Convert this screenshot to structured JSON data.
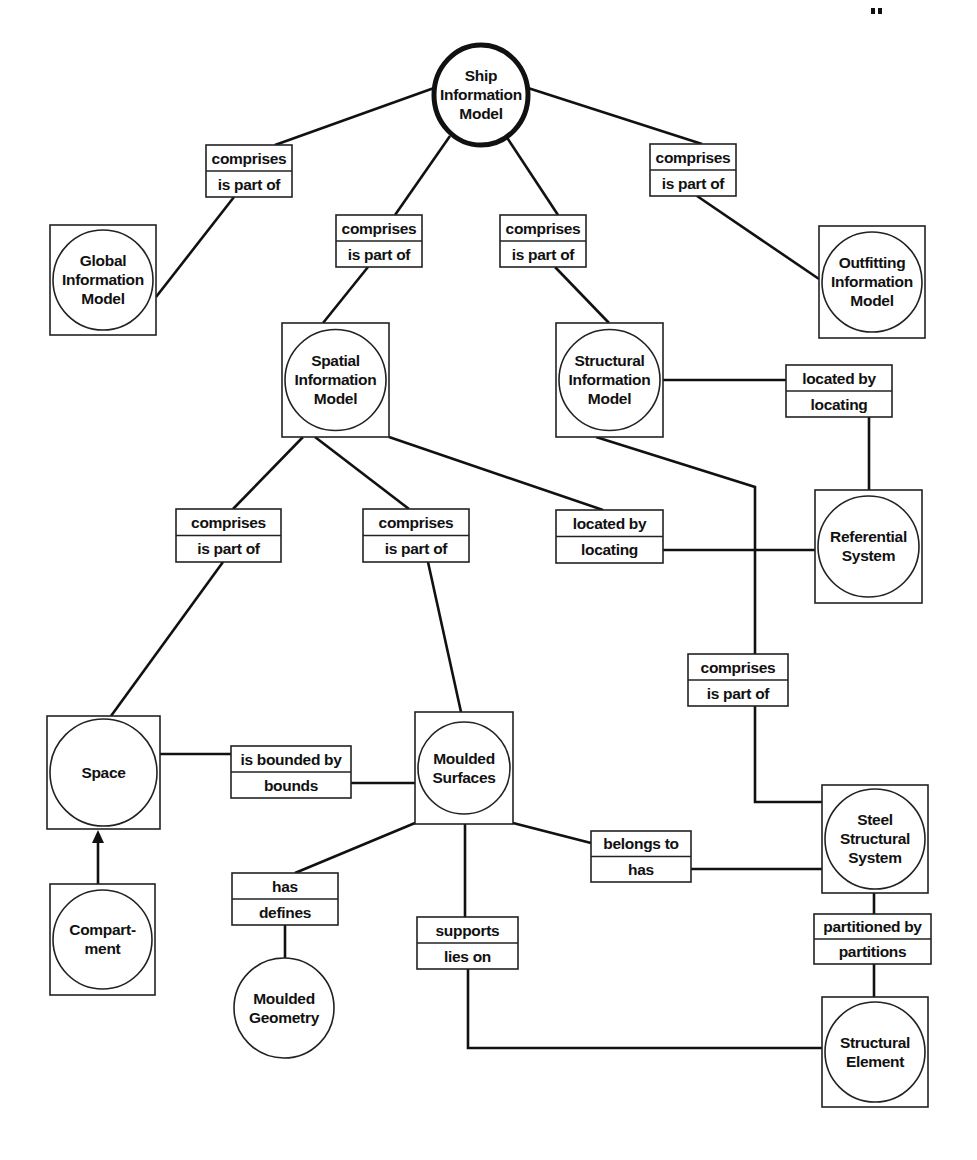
{
  "diagram": {
    "nodes": [
      {
        "id": "ship",
        "lines": [
          "Ship",
          "Information",
          "Model"
        ],
        "shape": "ellipse-root",
        "cx": 481,
        "cy": 95,
        "rx": 47,
        "ry": 50
      },
      {
        "id": "global",
        "lines": [
          "Global",
          "Information",
          "Model"
        ],
        "shape": "box-circle",
        "x": 50,
        "y": 225,
        "w": 106,
        "h": 110
      },
      {
        "id": "outfitting",
        "lines": [
          "Outfitting",
          "Information",
          "Model"
        ],
        "shape": "box-circle",
        "x": 819,
        "y": 226,
        "w": 106,
        "h": 112
      },
      {
        "id": "spatial",
        "lines": [
          "Spatial",
          "Information",
          "Model"
        ],
        "shape": "box-circle",
        "x": 282,
        "y": 323,
        "w": 107,
        "h": 114
      },
      {
        "id": "structural",
        "lines": [
          "Structural",
          "Information",
          "Model"
        ],
        "shape": "box-circle",
        "x": 556,
        "y": 323,
        "w": 107,
        "h": 114
      },
      {
        "id": "referential",
        "lines": [
          "Referential",
          "System"
        ],
        "shape": "box-circle",
        "x": 815,
        "y": 490,
        "w": 107,
        "h": 113
      },
      {
        "id": "space",
        "lines": [
          "Space"
        ],
        "shape": "box-circle",
        "x": 47,
        "y": 716,
        "w": 113,
        "h": 113
      },
      {
        "id": "moulded_surfaces",
        "lines": [
          "Moulded",
          "Surfaces"
        ],
        "shape": "box-circle",
        "x": 415,
        "y": 712,
        "w": 98,
        "h": 112
      },
      {
        "id": "steel",
        "lines": [
          "Steel",
          "Structural",
          "System"
        ],
        "shape": "box-circle",
        "x": 822,
        "y": 785,
        "w": 106,
        "h": 108
      },
      {
        "id": "compartment",
        "lines": [
          "Compart-",
          "ment"
        ],
        "shape": "box-circle",
        "x": 50,
        "y": 884,
        "w": 105,
        "h": 111
      },
      {
        "id": "moulded_geometry",
        "lines": [
          "Moulded",
          "Geometry"
        ],
        "shape": "circle",
        "cx": 284,
        "cy": 1008,
        "r": 50
      },
      {
        "id": "structural_element",
        "lines": [
          "Structural",
          "Element"
        ],
        "shape": "box-circle",
        "x": 822,
        "y": 997,
        "w": 106,
        "h": 110
      }
    ],
    "relations": [
      {
        "id": "ship-global",
        "forward": "comprises",
        "inverse": "is part of",
        "x": 206,
        "y": 145,
        "w": 86,
        "h": 52
      },
      {
        "id": "ship-spatial",
        "forward": "comprises",
        "inverse": "is part of",
        "x": 336,
        "y": 215,
        "w": 86,
        "h": 52
      },
      {
        "id": "ship-structural",
        "forward": "comprises",
        "inverse": "is part of",
        "x": 500,
        "y": 215,
        "w": 86,
        "h": 52
      },
      {
        "id": "ship-outfitting",
        "forward": "comprises",
        "inverse": "is part of",
        "x": 650,
        "y": 144,
        "w": 86,
        "h": 52
      },
      {
        "id": "structural-referential",
        "forward": "located by",
        "inverse": "locating",
        "x": 786,
        "y": 365,
        "w": 106,
        "h": 52
      },
      {
        "id": "spatial-space",
        "forward": "comprises",
        "inverse": "is part of",
        "x": 176,
        "y": 509,
        "w": 105,
        "h": 53
      },
      {
        "id": "spatial-moulded",
        "forward": "comprises",
        "inverse": "is part of",
        "x": 363,
        "y": 509,
        "w": 106,
        "h": 53
      },
      {
        "id": "spatial-referential",
        "forward": "located by",
        "inverse": "locating",
        "x": 556,
        "y": 510,
        "w": 107,
        "h": 53
      },
      {
        "id": "structural-steel",
        "forward": "comprises",
        "inverse": "is part of",
        "x": 688,
        "y": 654,
        "w": 100,
        "h": 52
      },
      {
        "id": "space-moulded",
        "forward": "is bounded by",
        "inverse": "bounds",
        "x": 231,
        "y": 746,
        "w": 120,
        "h": 52
      },
      {
        "id": "moulded-steel",
        "forward": "belongs to",
        "inverse": "has",
        "x": 591,
        "y": 831,
        "w": 100,
        "h": 51
      },
      {
        "id": "moulded-geometry",
        "forward": "has",
        "inverse": "defines",
        "x": 232,
        "y": 873,
        "w": 106,
        "h": 52
      },
      {
        "id": "moulded-element",
        "forward": "supports",
        "inverse": "lies on",
        "x": 417,
        "y": 917,
        "w": 101,
        "h": 52
      },
      {
        "id": "steel-element",
        "forward": "partitioned by",
        "inverse": "partitions",
        "x": 814,
        "y": 914,
        "w": 117,
        "h": 50
      }
    ],
    "edges": [
      {
        "points": [
          [
            434,
            88
          ],
          [
            275,
            145
          ]
        ]
      },
      {
        "points": [
          [
            234,
            197
          ],
          [
            156,
            297
          ]
        ]
      },
      {
        "points": [
          [
            450,
            136
          ],
          [
            395,
            215
          ]
        ]
      },
      {
        "points": [
          [
            368,
            267
          ],
          [
            323,
            323
          ]
        ]
      },
      {
        "points": [
          [
            506,
            136
          ],
          [
            558,
            215
          ]
        ]
      },
      {
        "points": [
          [
            555,
            267
          ],
          [
            609,
            323
          ]
        ]
      },
      {
        "points": [
          [
            528,
            88
          ],
          [
            702,
            144
          ]
        ]
      },
      {
        "points": [
          [
            697,
            196
          ],
          [
            819,
            279
          ]
        ]
      },
      {
        "points": [
          [
            663,
            380
          ],
          [
            786,
            380
          ]
        ]
      },
      {
        "points": [
          [
            869,
            417
          ],
          [
            869,
            490
          ]
        ]
      },
      {
        "points": [
          [
            303,
            437
          ],
          [
            233,
            509
          ]
        ]
      },
      {
        "points": [
          [
            223,
            562
          ],
          [
            111,
            716
          ]
        ]
      },
      {
        "points": [
          [
            315,
            437
          ],
          [
            409,
            509
          ]
        ]
      },
      {
        "points": [
          [
            428,
            562
          ],
          [
            461,
            712
          ]
        ]
      },
      {
        "points": [
          [
            389,
            437
          ],
          [
            603,
            510
          ]
        ]
      },
      {
        "points": [
          [
            663,
            550
          ],
          [
            815,
            550
          ]
        ]
      },
      {
        "points": [
          [
            596,
            437
          ],
          [
            755,
            487
          ],
          [
            755,
            654
          ]
        ]
      },
      {
        "points": [
          [
            755,
            706
          ],
          [
            755,
            802
          ],
          [
            822,
            802
          ]
        ]
      },
      {
        "points": [
          [
            160,
            754
          ],
          [
            231,
            754
          ]
        ]
      },
      {
        "points": [
          [
            351,
            783
          ],
          [
            415,
            783
          ]
        ]
      },
      {
        "points": [
          [
            513,
            823
          ],
          [
            591,
            843
          ]
        ]
      },
      {
        "points": [
          [
            691,
            869
          ],
          [
            822,
            869
          ]
        ]
      },
      {
        "points": [
          [
            415,
            823
          ],
          [
            295,
            873
          ]
        ]
      },
      {
        "points": [
          [
            285,
            925
          ],
          [
            285,
            958
          ]
        ]
      },
      {
        "points": [
          [
            465,
            824
          ],
          [
            465,
            917
          ]
        ]
      },
      {
        "points": [
          [
            468,
            969
          ],
          [
            468,
            1048
          ],
          [
            822,
            1048
          ]
        ]
      },
      {
        "points": [
          [
            874,
            893
          ],
          [
            874,
            914
          ]
        ]
      },
      {
        "points": [
          [
            874,
            964
          ],
          [
            874,
            997
          ]
        ]
      }
    ],
    "arrows": [
      {
        "from": [
          98,
          884
        ],
        "to": [
          98,
          830
        ],
        "head": "triangle"
      }
    ]
  }
}
